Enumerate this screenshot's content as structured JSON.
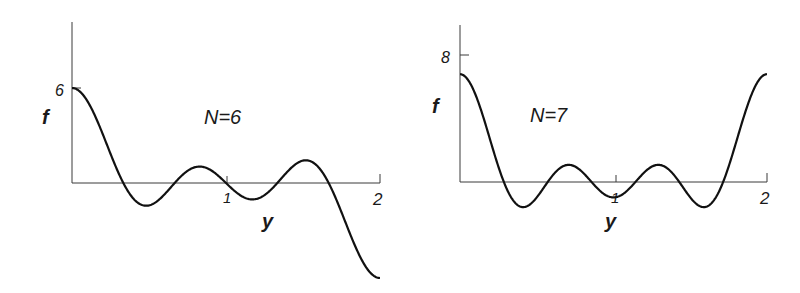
{
  "chart_data": [
    {
      "type": "line",
      "title": "N=6",
      "xlabel": "y",
      "ylabel": "f",
      "function": "f(y) = sin(N*pi*y/2) / sin(pi*y/2)",
      "N": 6,
      "xlim": [
        0,
        2
      ],
      "ylim": [
        -6,
        10
      ],
      "x_ticks": [
        "1",
        "2"
      ],
      "y_ticks": [
        "6"
      ],
      "grid": false,
      "x": [
        0,
        0.1667,
        0.3333,
        0.5,
        0.6667,
        0.8333,
        1.0,
        1.1667,
        1.3333,
        1.5,
        1.6667,
        1.8333,
        2.0
      ],
      "values": [
        6,
        0,
        0,
        1,
        0,
        0,
        -6,
        0,
        0,
        1,
        0,
        0,
        6
      ]
    },
    {
      "type": "line",
      "title": "N=7",
      "xlabel": "y",
      "ylabel": "f",
      "function": "f(y) = sin(N*pi*y/2) / sin(pi*y/2)",
      "N": 7,
      "xlim": [
        0,
        2
      ],
      "ylim": [
        -2.5,
        10
      ],
      "x_ticks": [
        "1",
        "2"
      ],
      "y_ticks": [
        "8"
      ],
      "grid": false,
      "x": [
        0,
        0.2857,
        0.5714,
        1.0,
        1.4286,
        1.7143,
        2.0
      ],
      "values": [
        7,
        0,
        0,
        7,
        0,
        0,
        7
      ]
    }
  ],
  "plots": [
    {
      "title": "N=6",
      "xlabel": "y",
      "ylabel": "f",
      "ytick": "6",
      "xtick1": "1",
      "xtick2": "2"
    },
    {
      "title": "N=7",
      "xlabel": "y",
      "ylabel": "f",
      "ytick": "8",
      "xtick1": "1",
      "xtick2": "2"
    }
  ]
}
